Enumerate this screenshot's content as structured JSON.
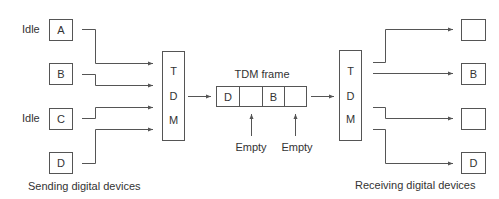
{
  "diagram": {
    "senders": [
      {
        "label": "A",
        "status": "Idle"
      },
      {
        "label": "B",
        "status": ""
      },
      {
        "label": "C",
        "status": "Idle"
      },
      {
        "label": "D",
        "status": ""
      }
    ],
    "mux_left": {
      "letters": [
        "T",
        "D",
        "M"
      ]
    },
    "mux_right": {
      "letters": [
        "T",
        "D",
        "M"
      ]
    },
    "frame": {
      "title": "TDM frame",
      "slots": [
        "D",
        "",
        "B",
        ""
      ],
      "empty_labels": [
        "Empty",
        "Empty"
      ]
    },
    "receivers": [
      {
        "label": ""
      },
      {
        "label": "B"
      },
      {
        "label": ""
      },
      {
        "label": "D"
      }
    ],
    "captions": {
      "sending": "Sending digital devices",
      "receiving": "Receiving digital devices"
    }
  }
}
